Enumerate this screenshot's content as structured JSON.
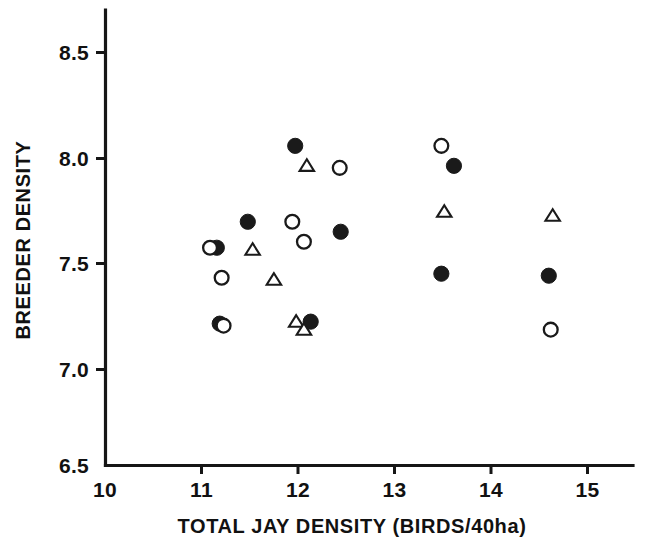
{
  "chart_data": {
    "type": "scatter",
    "title": "",
    "xlabel": "TOTAL JAY DENSITY (BIRDS/40ha)",
    "ylabel": "BREEDER DENSITY",
    "xlim": [
      10,
      15.45
    ],
    "ylim": [
      6.5,
      8.78
    ],
    "grid": false,
    "legend": "none",
    "xticks": [
      10,
      11,
      12,
      13,
      14,
      15
    ],
    "xticklabels": [
      "10",
      "11",
      "12",
      "13",
      "14",
      "15"
    ],
    "yticks": [
      6.5,
      7.0,
      7.5,
      8.0,
      8.5
    ],
    "yticklabels": [
      "6.5",
      "7.0",
      "7.5",
      "8.0",
      "8.5"
    ],
    "series": [
      {
        "name": "filled-circle",
        "marker": "filled-circle",
        "color": "#1a1a1a",
        "points": [
          {
            "x": 11.18,
            "y": 7.21
          },
          {
            "x": 11.47,
            "y": 7.72
          },
          {
            "x": 11.15,
            "y": 7.59
          },
          {
            "x": 11.96,
            "y": 8.1
          },
          {
            "x": 12.12,
            "y": 7.22
          },
          {
            "x": 12.43,
            "y": 7.67
          },
          {
            "x": 13.6,
            "y": 8.0
          },
          {
            "x": 13.47,
            "y": 7.46
          },
          {
            "x": 14.58,
            "y": 7.45
          }
        ]
      },
      {
        "name": "open-circle",
        "marker": "open-circle",
        "color": "#1a1a1a",
        "points": [
          {
            "x": 11.08,
            "y": 7.59
          },
          {
            "x": 11.2,
            "y": 7.44
          },
          {
            "x": 11.22,
            "y": 7.2
          },
          {
            "x": 11.93,
            "y": 7.72
          },
          {
            "x": 12.05,
            "y": 7.62
          },
          {
            "x": 12.42,
            "y": 7.99
          },
          {
            "x": 13.47,
            "y": 8.1
          },
          {
            "x": 14.6,
            "y": 7.18
          }
        ]
      },
      {
        "name": "open-triangle",
        "marker": "open-triangle",
        "color": "#1a1a1a",
        "points": [
          {
            "x": 11.52,
            "y": 7.58
          },
          {
            "x": 11.74,
            "y": 7.43
          },
          {
            "x": 11.97,
            "y": 7.22
          },
          {
            "x": 12.08,
            "y": 8.0
          },
          {
            "x": 12.05,
            "y": 7.18
          },
          {
            "x": 13.5,
            "y": 7.77
          },
          {
            "x": 14.62,
            "y": 7.75
          }
        ]
      }
    ]
  }
}
